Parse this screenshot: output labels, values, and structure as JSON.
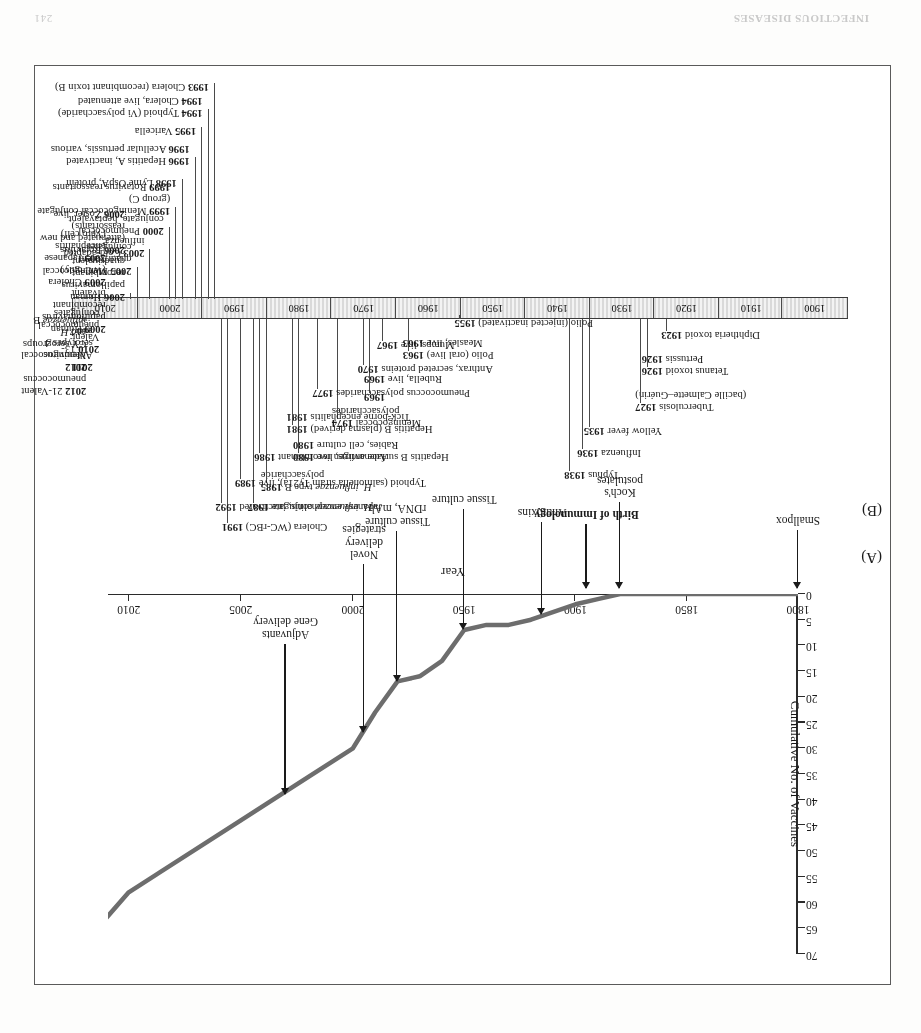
{
  "page": {
    "running_footer_left": "INFECTIOUS DISEASES",
    "running_footer_right": "241",
    "header_faint": ""
  },
  "figure": {
    "panel_a_tag": "(A)",
    "panel_b_tag": "(B)"
  },
  "chart_data": {
    "type": "line",
    "title": "",
    "xlabel": "Year",
    "ylabel": "Cumulative No. of Vaccines",
    "xticks": [
      "1800",
      "1850",
      "1900",
      "1950",
      "2000",
      "2005",
      "2010"
    ],
    "yticks": [
      0,
      5,
      10,
      15,
      20,
      25,
      30,
      35,
      40,
      45,
      50,
      55,
      60,
      65,
      70
    ],
    "ylim": [
      0,
      70
    ],
    "grid": false,
    "legend": "none",
    "note": "x-axis is non-linear: 1800-2000 evenly spaced per 50 years, then 2000-2005-2010 expanded",
    "x": [
      1800,
      1860,
      1880,
      1890,
      1900,
      1920,
      1930,
      1940,
      1950,
      1960,
      1970,
      1980,
      1990,
      2000,
      2005,
      2010,
      2012
    ],
    "values": [
      0,
      0,
      0,
      1,
      2,
      5,
      6,
      6,
      7,
      13,
      16,
      17,
      23,
      30,
      44,
      58,
      68
    ],
    "annotations": [
      {
        "label": "Smallpox",
        "year": 1800,
        "value": 0,
        "bold": false
      },
      {
        "label": "Koch's\npostulates",
        "year": 1880,
        "value": 0,
        "bold": false
      },
      {
        "label": "Birth of Immunology",
        "year": 1895,
        "value": 0,
        "bold": true
      },
      {
        "label": "Antitoxins",
        "year": 1915,
        "value": 5,
        "bold": false
      },
      {
        "label": "Tissue culture",
        "year": 1950,
        "value": 8,
        "bold": false
      },
      {
        "label": "Tissue culture\nrDNA, mAb",
        "year": 1980,
        "value": 18,
        "bold": false
      },
      {
        "label": "Novel\ndelivery\nstrategies",
        "year": 1995,
        "value": 28,
        "bold": false
      },
      {
        "label": "Adjuvants\nGene delivery",
        "year": 2003,
        "value": 40,
        "bold": false
      }
    ]
  },
  "timeline": {
    "decades": [
      "1900",
      "1910",
      "1920",
      "1930",
      "1940",
      "1950",
      "1960",
      "1970",
      "1980",
      "1990",
      "2000",
      "2010"
    ],
    "events_above": [
      {
        "year": 1923,
        "text": "Diphtheria toxoid 1923",
        "bold_part": "1923"
      },
      {
        "year": 1926,
        "text": "Tetanus toxoid 1926\nPertussis 1926"
      },
      {
        "year": 1927,
        "text": "Tuberculosis 1927\n(bacille Calmette–Guérin)"
      },
      {
        "year": 1935,
        "text": "Yellow fever 1935"
      },
      {
        "year": 1936,
        "text": "Influenza 1936"
      },
      {
        "year": 1938,
        "text": "Typhus 1938"
      },
      {
        "year": 1955,
        "text": "Polio (injected inactivated) 1955"
      },
      {
        "year": 1963,
        "text": "Polio (oral live) 1963\nMeasles, live 1963"
      },
      {
        "year": 1969,
        "text": "Rubella, live 1969"
      },
      {
        "year": 1969,
        "text": "1969"
      },
      {
        "year": 1974,
        "text": "Meningococcal 1974\npolysaccharides"
      },
      {
        "year": 1980,
        "text": "Adenovirus, live 1980\nRabies, cell culture 1980"
      },
      {
        "year": 1985,
        "text": "H. influenzae type B 1985\npolysaccharide"
      },
      {
        "year": 1987,
        "text": "H. influenzae conjugate 1987"
      },
      {
        "year": 1991,
        "text": "Cholera (WC-rBC) 1991"
      },
      {
        "year": 1967,
        "text": "Mumps, live 1967"
      },
      {
        "year": 1970,
        "text": "Anthrax, secreted proteins 1970"
      },
      {
        "year": 1977,
        "text": "Pneumococcus polysaccharides 1977"
      },
      {
        "year": 1981,
        "text": "Hepatitis B (plasma derived) 1981\nTick-borne encephalitis 1981"
      },
      {
        "year": 1986,
        "text": "Hepatitis B surface antigen recombinant 1986"
      },
      {
        "year": 1989,
        "text": "Typhoid (salmonella strain Ty21a), live 1989"
      },
      {
        "year": 1992,
        "text": "Japanese encephalitis, inactivated 1992"
      }
    ],
    "events_below": [
      {
        "year": 1993,
        "text": "1993 Cholera (recombinant toxin B)"
      },
      {
        "year": 1994,
        "text": "1994 Typhoid (Vi polysaccharide)\n1994 Cholera, live attenuated"
      },
      {
        "year": 1995,
        "text": "1995 Varicella"
      },
      {
        "year": 1996,
        "text": "1996 Hepatitis A, inactivated\n1996 Acellular pertussis, various"
      },
      {
        "year": 1998,
        "text": "1998 Lyme OspA, protein"
      },
      {
        "year": 1999,
        "text": "1999 Meningococcal conjugate (group C)\n1999 Rotavirus reassortants"
      },
      {
        "year": 2000,
        "text": "2000 Pneumococcal conjugate, heptavalent"
      },
      {
        "year": 2003,
        "text": "2003 Cold-adapted influenza"
      },
      {
        "year": 2005,
        "text": "2005 Meningococcal quadrivalent conjugates"
      },
      {
        "year": 2006,
        "text": "2006 Human papillomavirus recombinant quadrivalent\n2006 Rotavirus (attenuated and new reassortants)\n2006 Zoster, live"
      },
      {
        "year": 2009,
        "text": "2009 Human papillomavirus recombinant bivalent\n2009 Cholera (WC only)\n2009 Japanese encephalitis (Vero cell)"
      },
      {
        "year": 2010,
        "text": "2010 13-Valent pneumococcal conjugates"
      },
      {
        "year": 2011,
        "text": "2011 Adenovirus serotypes 4 and 7"
      },
      {
        "year": 2012,
        "text": "2012 21-Valent pneumococcus\n2012 Meningococcal CY serogroups\nand H. influenzae B"
      }
    ]
  }
}
